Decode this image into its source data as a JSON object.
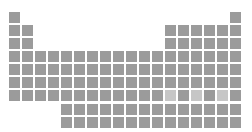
{
  "colors": {
    "background": "#ffffff",
    "element": "#9b9b9b",
    "highlight": "#c6c6c6"
  },
  "layout": {
    "origin_x": 9,
    "origin_y": 12,
    "pitch": 13,
    "cell_size": 11,
    "f_block_top": 104,
    "f_block_start_col": 5
  },
  "highlighted": [
    "Nh",
    "Mc",
    "Ts"
  ],
  "main_rows": [
    {
      "period": 1,
      "cols": [
        1,
        18
      ],
      "symbols": [
        "H",
        "He"
      ]
    },
    {
      "period": 2,
      "cols": [
        1,
        2,
        13,
        14,
        15,
        16,
        17,
        18
      ],
      "symbols": [
        "Li",
        "Be",
        "B",
        "C",
        "N",
        "O",
        "F",
        "Ne"
      ]
    },
    {
      "period": 3,
      "cols": [
        1,
        2,
        13,
        14,
        15,
        16,
        17,
        18
      ],
      "symbols": [
        "Na",
        "Mg",
        "Al",
        "Si",
        "P",
        "S",
        "Cl",
        "Ar"
      ]
    },
    {
      "period": 4,
      "cols": [
        1,
        2,
        3,
        4,
        5,
        6,
        7,
        8,
        9,
        10,
        11,
        12,
        13,
        14,
        15,
        16,
        17,
        18
      ],
      "symbols": [
        "K",
        "Ca",
        "Sc",
        "Ti",
        "V",
        "Cr",
        "Mn",
        "Fe",
        "Co",
        "Ni",
        "Cu",
        "Zn",
        "Ga",
        "Ge",
        "As",
        "Se",
        "Br",
        "Kr"
      ]
    },
    {
      "period": 5,
      "cols": [
        1,
        2,
        3,
        4,
        5,
        6,
        7,
        8,
        9,
        10,
        11,
        12,
        13,
        14,
        15,
        16,
        17,
        18
      ],
      "symbols": [
        "Rb",
        "Sr",
        "Y",
        "Zr",
        "Nb",
        "Mo",
        "Tc",
        "Ru",
        "Rh",
        "Pd",
        "Ag",
        "Cd",
        "In",
        "Sn",
        "Sb",
        "Te",
        "I",
        "Xe"
      ]
    },
    {
      "period": 6,
      "cols": [
        1,
        2,
        3,
        4,
        5,
        6,
        7,
        8,
        9,
        10,
        11,
        12,
        13,
        14,
        15,
        16,
        17,
        18
      ],
      "symbols": [
        "Cs",
        "Ba",
        "Lu",
        "Hf",
        "Ta",
        "W",
        "Re",
        "Os",
        "Ir",
        "Pt",
        "Au",
        "Hg",
        "Tl",
        "Pb",
        "Bi",
        "Po",
        "At",
        "Rn"
      ]
    },
    {
      "period": 7,
      "cols": [
        1,
        2,
        3,
        4,
        5,
        6,
        7,
        8,
        9,
        10,
        11,
        12,
        13,
        14,
        15,
        16,
        17,
        18
      ],
      "symbols": [
        "Fr",
        "Ra",
        "Lr",
        "Rf",
        "Db",
        "Sg",
        "Bh",
        "Hs",
        "Mt",
        "Ds",
        "Rg",
        "Cn",
        "Nh",
        "Fl",
        "Mc",
        "Lv",
        "Ts",
        "Og"
      ]
    }
  ],
  "f_block": [
    {
      "series": "lanthanides",
      "symbols": [
        "La",
        "Ce",
        "Pr",
        "Nd",
        "Pm",
        "Sm",
        "Eu",
        "Gd",
        "Tb",
        "Dy",
        "Ho",
        "Er",
        "Tm",
        "Yb"
      ]
    },
    {
      "series": "actinides",
      "symbols": [
        "Ac",
        "Th",
        "Pa",
        "U",
        "Np",
        "Pu",
        "Am",
        "Cm",
        "Bk",
        "Cf",
        "Es",
        "Fm",
        "Md",
        "No"
      ]
    }
  ]
}
